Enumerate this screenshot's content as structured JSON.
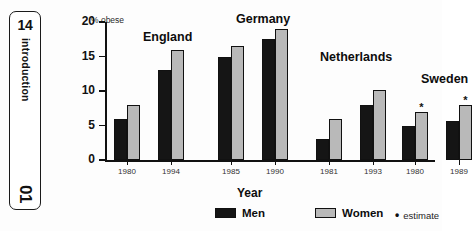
{
  "page_tab": {
    "page_number": "14",
    "section": "introduction",
    "chapter": "01"
  },
  "chart_data": {
    "type": "bar",
    "title": "",
    "ylabel": "% obese",
    "xlabel": "Year",
    "ylim": [
      0,
      20
    ],
    "yticks": [
      "0",
      "5",
      "10",
      "15",
      "20"
    ],
    "grid": false,
    "legend_position": "bottom",
    "categories": [
      "1980",
      "1994",
      "1985",
      "1990",
      "1981",
      "1993",
      "1980",
      "1989"
    ],
    "groups": [
      {
        "country": "England",
        "years": [
          "1980",
          "1994"
        ],
        "men": [
          6,
          13
        ],
        "women": [
          8,
          16
        ],
        "estimate_flags": [
          false,
          false
        ]
      },
      {
        "country": "Germany",
        "years": [
          "1985",
          "1990"
        ],
        "men": [
          15,
          17.5
        ],
        "women": [
          16.5,
          19
        ],
        "estimate_flags": [
          false,
          false
        ]
      },
      {
        "country": "Netherlands",
        "years": [
          "1981",
          "1993"
        ],
        "men": [
          3,
          8
        ],
        "women": [
          6,
          10.2
        ],
        "estimate_flags": [
          false,
          false
        ]
      },
      {
        "country": "Sweden",
        "years": [
          "1980",
          "1989"
        ],
        "men": [
          5,
          5.6
        ],
        "women": [
          7,
          8
        ],
        "estimate_flags": [
          true,
          true
        ]
      }
    ],
    "series": [
      {
        "name": "Men",
        "color": "#151515",
        "values": [
          6,
          13,
          15,
          17.5,
          3,
          8,
          5,
          5.6
        ]
      },
      {
        "name": "Women",
        "color": "#b9b9b9",
        "values": [
          8,
          16,
          16.5,
          19,
          6,
          10.2,
          7,
          8
        ]
      }
    ],
    "legend": [
      {
        "label": "Men",
        "swatch": "men"
      },
      {
        "label": "Women",
        "swatch": "women"
      }
    ],
    "estimate_note": {
      "marker": "•",
      "label": "estimate"
    },
    "estimate_marker_glyph": "*"
  }
}
